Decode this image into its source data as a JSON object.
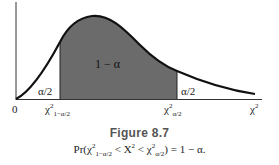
{
  "figure": {
    "title": "Figure 8.7",
    "caption": "Pr(χ²₁₋α/₂ < X² < χ²α/₂) = 1 − α."
  },
  "diagram": {
    "type": "chi-square density with two-sided critical region",
    "axis": {
      "origin_label": "0",
      "x_label": "χ²"
    },
    "critical_values": {
      "lower": "χ²₁₋α/₂",
      "upper": "χ²α/₂"
    },
    "regions": {
      "left_tail": "α/2",
      "center": "1 − α",
      "right_tail": "α/2"
    },
    "colors": {
      "center_fill": "#6b6b6b",
      "curve": "#111111"
    }
  }
}
